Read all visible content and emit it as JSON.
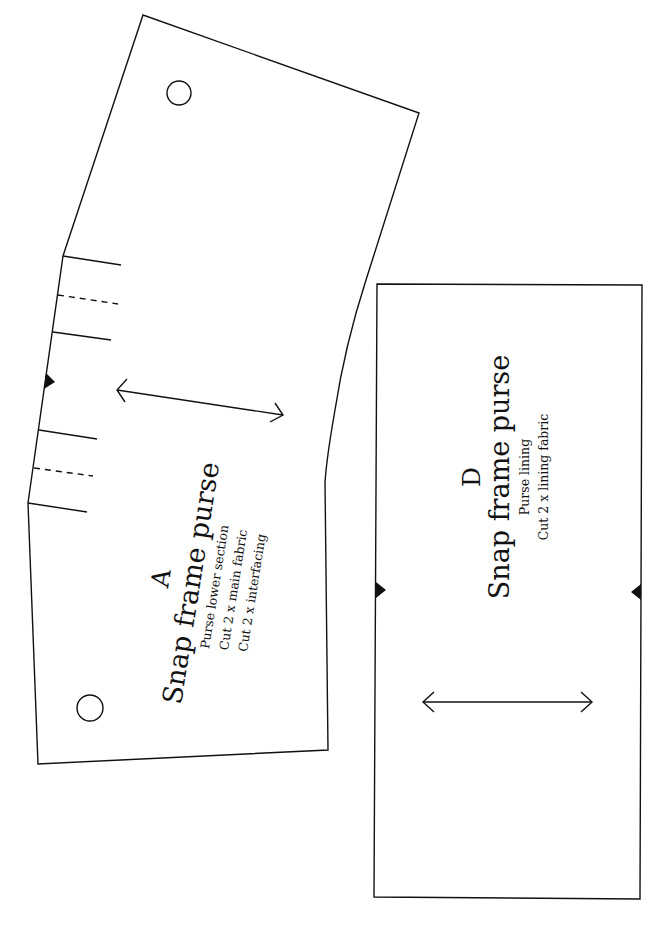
{
  "page": {
    "background": "#ffffff",
    "line_color": "#111111"
  },
  "pieces": [
    {
      "id": "A",
      "letter": "A",
      "title": "Snap frame purse",
      "lines": [
        "Purse lower section",
        "Cut 2 x main fabric",
        "Cut 2 x interfacing"
      ],
      "markings": [
        "grainline-arrow",
        "notch",
        "pleat-lines",
        "snap-circles"
      ]
    },
    {
      "id": "D",
      "letter": "D",
      "title": "Snap frame purse",
      "lines": [
        "Purse lining",
        "Cut 2 x lining fabric"
      ],
      "markings": [
        "grainline-arrow",
        "notch-left",
        "notch-right"
      ]
    }
  ]
}
